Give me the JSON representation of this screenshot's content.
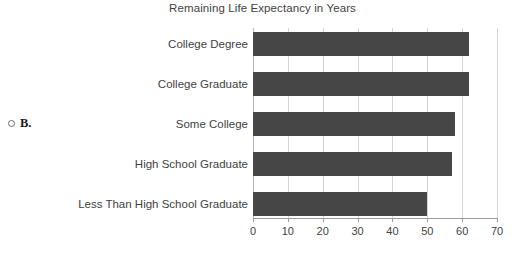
{
  "choice": {
    "radio_name": "radio-unselected-icon",
    "letter": "B."
  },
  "chart_data": {
    "type": "bar",
    "orientation": "horizontal",
    "title": "Remaining Life Expectancy in Years",
    "xlabel": "",
    "ylabel": "",
    "categories": [
      "College Degree",
      "College Graduate",
      "Some College",
      "High School Graduate",
      "Less Than High School Graduate"
    ],
    "values": [
      62,
      62,
      58,
      57,
      50
    ],
    "xlim": [
      0,
      70
    ],
    "xticks": [
      0,
      10,
      20,
      30,
      40,
      50,
      60,
      70
    ],
    "xtick_labels": [
      "0",
      "10",
      "20",
      "30",
      "40",
      "50",
      "60",
      "70"
    ],
    "grid": true,
    "grid_axis": "x",
    "legend": false,
    "bar_color": "#464646",
    "gridline_color": "#d4d4d4",
    "axis_color": "#9a9a9a",
    "text_color": "#3f3f3f"
  }
}
